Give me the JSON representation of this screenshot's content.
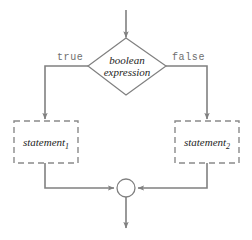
{
  "diagram": {
    "type": "flowchart",
    "colors": {
      "line": "#808080",
      "node_border_solid": "#808080",
      "node_border_dashed": "#8a8a8a",
      "text": "#1d1d1d",
      "label_text": "#6e6e6e",
      "background": "#ffffff"
    },
    "nodes": [
      {
        "id": "entry-arrow",
        "name": "entry-arrow",
        "shape": "arrow",
        "direction": "down",
        "label": ""
      },
      {
        "id": "condition",
        "name": "condition-diamond",
        "shape": "diamond",
        "line1": "boolean",
        "line2": "expression",
        "style": "solid"
      },
      {
        "id": "statement1",
        "name": "statement-1-box",
        "shape": "rectangle",
        "style": "dashed",
        "text": "statement",
        "subscript": "1"
      },
      {
        "id": "statement2",
        "name": "statement-2-box",
        "shape": "rectangle",
        "style": "dashed",
        "text": "statement",
        "subscript": "2"
      },
      {
        "id": "merge",
        "name": "merge-circle",
        "shape": "circle",
        "style": "solid",
        "label": ""
      },
      {
        "id": "exit-arrow",
        "name": "exit-arrow",
        "shape": "arrow",
        "direction": "down",
        "label": ""
      }
    ],
    "edges": [
      {
        "id": "e-entry",
        "from": "entry-arrow",
        "to": "condition",
        "label": ""
      },
      {
        "id": "e-true",
        "from": "condition",
        "to": "statement1",
        "label": "true"
      },
      {
        "id": "e-false",
        "from": "condition",
        "to": "statement2",
        "label": "false"
      },
      {
        "id": "e-join-l",
        "from": "statement1",
        "to": "merge",
        "label": ""
      },
      {
        "id": "e-join-r",
        "from": "statement2",
        "to": "merge",
        "label": ""
      },
      {
        "id": "e-exit",
        "from": "merge",
        "to": "exit-arrow",
        "label": ""
      }
    ]
  }
}
